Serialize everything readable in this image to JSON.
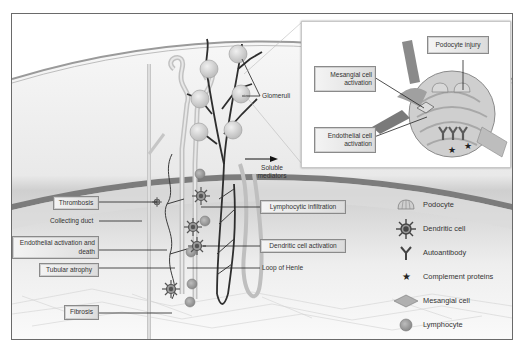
{
  "diagram": {
    "type": "kidney-pathology-schematic",
    "main_labels": {
      "thrombosis": "Thrombosis",
      "collecting_duct": "Collecting duct",
      "endothelial_activation_death": "Endothelial activation and death",
      "tubular_atrophy": "Tubular atrophy",
      "fibrosis": "Fibrosis",
      "glomeruli": "Glomeruli",
      "soluble_mediators": "Soluble mediators",
      "lymphocytic_infiltration": "Lymphocytic infiltration",
      "dendritic_cell_activation": "Dendritic cell activation",
      "loop_of_henle": "Loop of Henle"
    },
    "inset_labels": {
      "podocyte_injury": "Podocyte injury",
      "mesangial_cell_activation": "Mesangial cell activation",
      "endothelial_cell_activation": "Endothelial cell activation"
    },
    "legend": [
      {
        "icon": "podocyte-icon",
        "label": "Podocyte"
      },
      {
        "icon": "dendritic-cell-icon",
        "label": "Dendritic cell"
      },
      {
        "icon": "autoantibody-icon",
        "label": "Autoantibody"
      },
      {
        "icon": "complement-protein-icon",
        "label": "Complement proteins"
      },
      {
        "icon": "mesangial-cell-icon",
        "label": "Mesangial cell"
      },
      {
        "icon": "lymphocyte-icon",
        "label": "Lymphocyte"
      }
    ],
    "colors": {
      "frame": "#6a6a6a",
      "cortex_band": "#7a7a7a",
      "vessel_dark": "#2a2a2a",
      "tubule": "#c8c8c8",
      "glomerulus": "#d0d0d0"
    }
  }
}
